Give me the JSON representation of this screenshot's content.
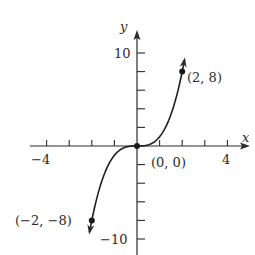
{
  "chart_data": {
    "type": "line",
    "title": "",
    "function": "y = x^3",
    "xlabel": "x",
    "ylabel": "y",
    "xlim": [
      -4,
      4
    ],
    "ylim": [
      -10,
      10
    ],
    "grid": false,
    "legend": null,
    "x_ticks": [
      -4,
      -3,
      -2,
      -1,
      1,
      2,
      3,
      4
    ],
    "x_tick_labels": [
      {
        "value": -4,
        "label": "−4"
      },
      {
        "value": 4,
        "label": "4"
      }
    ],
    "y_ticks": [
      -10,
      -8,
      -6,
      -4,
      -2,
      2,
      4,
      6,
      8,
      10
    ],
    "y_tick_labels": [
      {
        "value": 10,
        "label": "10"
      },
      {
        "value": -10,
        "label": "−10"
      }
    ],
    "series": [
      {
        "name": "y = x^3",
        "x": [
          -2.1,
          -2,
          -1.5,
          -1,
          -0.5,
          0,
          0.5,
          1,
          1.5,
          2,
          2.1
        ],
        "y": [
          -9.26,
          -8,
          -3.375,
          -1,
          -0.125,
          0,
          0.125,
          1,
          3.375,
          8,
          9.26
        ],
        "arrows_at_ends": true
      }
    ],
    "annotations": [
      {
        "x": 2,
        "y": 8,
        "text": "(2, 8)"
      },
      {
        "x": 0,
        "y": 0,
        "text": "(0, 0)"
      },
      {
        "x": -2,
        "y": -8,
        "text": "(−2, −8)"
      }
    ]
  },
  "labels": {
    "x_axis": "x",
    "y_axis": "y",
    "x_min": "−4",
    "x_max": "4",
    "y_max": "10",
    "y_min": "−10",
    "pt_pos": "(2, 8)",
    "pt_origin": "(0, 0)",
    "pt_neg": "(−2, −8)"
  }
}
